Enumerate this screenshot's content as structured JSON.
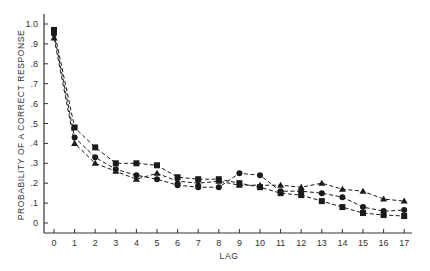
{
  "chart_data": {
    "type": "line",
    "title": "",
    "xlabel": "LAG",
    "ylabel": "PROBABILITY OF A CORRECT RESPONSE",
    "x": [
      0,
      1,
      2,
      3,
      4,
      5,
      6,
      7,
      8,
      9,
      10,
      11,
      12,
      13,
      14,
      15,
      16,
      17
    ],
    "xticks": [
      "0",
      "1",
      "2",
      "3",
      "4",
      "5",
      "6",
      "7",
      "8",
      "9",
      "10",
      "11",
      "12",
      "13",
      "14",
      "15",
      "16",
      "17"
    ],
    "yticks": [
      "0",
      ".1",
      ".2",
      ".3",
      ".4",
      ".5",
      ".6",
      ".7",
      ".8",
      ".9",
      "1.0"
    ],
    "ylim": [
      0,
      1.0
    ],
    "xlim": [
      0,
      17
    ],
    "grid": false,
    "legend": null,
    "series": [
      {
        "name": "square",
        "marker": "square",
        "linestyle": "dashed",
        "values": [
          0.97,
          0.48,
          0.38,
          0.3,
          0.3,
          0.29,
          0.23,
          0.22,
          0.22,
          0.2,
          0.18,
          0.15,
          0.14,
          0.11,
          0.08,
          0.05,
          0.04,
          0.035
        ]
      },
      {
        "name": "circle",
        "marker": "circle",
        "linestyle": "dashed",
        "values": [
          0.95,
          0.43,
          0.33,
          0.27,
          0.24,
          0.22,
          0.19,
          0.18,
          0.18,
          0.25,
          0.24,
          0.16,
          0.16,
          0.15,
          0.13,
          0.08,
          0.06,
          0.065
        ]
      },
      {
        "name": "triangle",
        "marker": "triangle",
        "linestyle": "dashed",
        "values": [
          0.93,
          0.4,
          0.3,
          0.26,
          0.22,
          0.25,
          0.21,
          0.2,
          0.21,
          0.19,
          0.19,
          0.19,
          0.18,
          0.2,
          0.17,
          0.16,
          0.12,
          0.11
        ]
      }
    ]
  },
  "colors": {
    "ink": "#1a1a1a",
    "axis": "#333333",
    "background": "#ffffff"
  }
}
